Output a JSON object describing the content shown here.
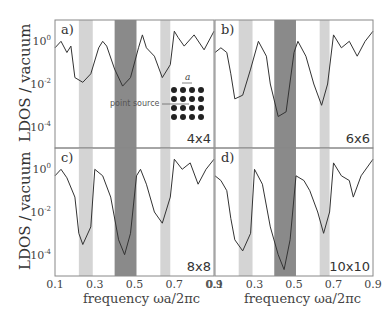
{
  "figure": {
    "ylabel": "LDOS / vacuum",
    "xlabel": "frequency ωa/2πc",
    "inset": {
      "annotation": "point source",
      "lattice_label": "a",
      "grid": "4x4"
    }
  },
  "chart_data": [
    {
      "type": "line",
      "panel": "a)",
      "size_label": "4x4",
      "xlabel": "frequency ωa/2πc",
      "ylabel": "LDOS / vacuum",
      "yscale": "log",
      "xlim": [
        0.1,
        0.9
      ],
      "ylim": [
        1e-05,
        10
      ],
      "yticks": [
        "10^0",
        "10^-2",
        "10^-4"
      ],
      "xticks": [],
      "bands": [
        {
          "from": 0.22,
          "to": 0.29,
          "shade": "light"
        },
        {
          "from": 0.4,
          "to": 0.51,
          "shade": "dark"
        },
        {
          "from": 0.63,
          "to": 0.68,
          "shade": "light"
        }
      ],
      "x": [
        0.1,
        0.13,
        0.16,
        0.18,
        0.2,
        0.24,
        0.28,
        0.32,
        0.34,
        0.36,
        0.4,
        0.44,
        0.48,
        0.52,
        0.54,
        0.56,
        0.6,
        0.64,
        0.68,
        0.7,
        0.72,
        0.75,
        0.8,
        0.85,
        0.9
      ],
      "values": [
        0.5,
        1.0,
        0.3,
        0.6,
        0.02,
        0.012,
        0.03,
        0.5,
        1.0,
        0.6,
        0.05,
        0.008,
        0.02,
        0.5,
        2.0,
        0.5,
        0.2,
        0.02,
        0.08,
        3.0,
        1.5,
        0.6,
        2.0,
        0.4,
        3.0
      ]
    },
    {
      "type": "line",
      "panel": "b)",
      "size_label": "6x6",
      "xlabel": "frequency ωa/2πc",
      "ylabel": "",
      "yscale": "log",
      "xlim": [
        0.1,
        0.9
      ],
      "ylim": [
        1e-05,
        10
      ],
      "bands": [
        {
          "from": 0.22,
          "to": 0.29,
          "shade": "light"
        },
        {
          "from": 0.4,
          "to": 0.51,
          "shade": "dark"
        },
        {
          "from": 0.63,
          "to": 0.68,
          "shade": "light"
        }
      ],
      "x": [
        0.1,
        0.13,
        0.16,
        0.18,
        0.2,
        0.24,
        0.28,
        0.32,
        0.36,
        0.38,
        0.42,
        0.46,
        0.5,
        0.52,
        0.56,
        0.6,
        0.64,
        0.67,
        0.7,
        0.74,
        0.78,
        0.82,
        0.86,
        0.9
      ],
      "values": [
        0.3,
        0.5,
        0.3,
        0.03,
        0.002,
        0.003,
        0.05,
        1.0,
        0.2,
        0.01,
        0.0003,
        0.0005,
        0.3,
        1.0,
        0.2,
        0.01,
        0.001,
        0.01,
        2.0,
        0.5,
        1.0,
        0.2,
        1.0,
        3.0
      ]
    },
    {
      "type": "line",
      "panel": "c)",
      "size_label": "8x8",
      "xlabel": "frequency ωa/2πc",
      "ylabel": "LDOS / vacuum",
      "yscale": "log",
      "xlim": [
        0.1,
        0.9
      ],
      "ylim": [
        1e-05,
        10
      ],
      "yticks": [
        "10^0",
        "10^-2",
        "10^-4"
      ],
      "xticks": [
        "0.1",
        "0.3",
        "0.5",
        "0.7",
        "0.9"
      ],
      "bands": [
        {
          "from": 0.22,
          "to": 0.29,
          "shade": "light"
        },
        {
          "from": 0.4,
          "to": 0.51,
          "shade": "dark"
        },
        {
          "from": 0.63,
          "to": 0.68,
          "shade": "light"
        }
      ],
      "x": [
        0.1,
        0.13,
        0.16,
        0.2,
        0.22,
        0.24,
        0.28,
        0.3,
        0.34,
        0.38,
        0.42,
        0.45,
        0.48,
        0.51,
        0.53,
        0.56,
        0.6,
        0.64,
        0.68,
        0.7,
        0.74,
        0.78,
        0.82,
        0.86,
        0.9
      ],
      "values": [
        0.5,
        1.0,
        0.4,
        0.05,
        0.001,
        0.0003,
        0.002,
        1.0,
        0.5,
        0.05,
        0.0005,
        0.0001,
        0.001,
        0.5,
        1.0,
        0.2,
        0.01,
        0.003,
        0.05,
        3.0,
        1.0,
        2.0,
        0.2,
        1.0,
        3.0
      ]
    },
    {
      "type": "line",
      "panel": "d)",
      "size_label": "10x10",
      "xlabel": "frequency ωa/2πc",
      "ylabel": "",
      "yscale": "log",
      "xlim": [
        0.1,
        0.9
      ],
      "ylim": [
        1e-05,
        10
      ],
      "xticks": [
        "0.1",
        "0.3",
        "0.5",
        "0.7",
        "0.9"
      ],
      "bands": [
        {
          "from": 0.22,
          "to": 0.29,
          "shade": "light"
        },
        {
          "from": 0.4,
          "to": 0.51,
          "shade": "dark"
        },
        {
          "from": 0.63,
          "to": 0.68,
          "shade": "light"
        }
      ],
      "x": [
        0.1,
        0.13,
        0.16,
        0.18,
        0.2,
        0.24,
        0.28,
        0.3,
        0.34,
        0.38,
        0.42,
        0.45,
        0.48,
        0.51,
        0.55,
        0.58,
        0.62,
        0.65,
        0.68,
        0.7,
        0.74,
        0.78,
        0.8,
        0.84,
        0.9
      ],
      "values": [
        0.5,
        0.3,
        0.1,
        0.005,
        0.0005,
        0.00015,
        0.001,
        1.0,
        0.2,
        0.002,
        0.0001,
        2e-05,
        0.0005,
        0.5,
        0.3,
        0.1,
        0.01,
        0.001,
        0.01,
        2.0,
        0.5,
        0.3,
        0.05,
        0.5,
        3.0
      ]
    }
  ]
}
